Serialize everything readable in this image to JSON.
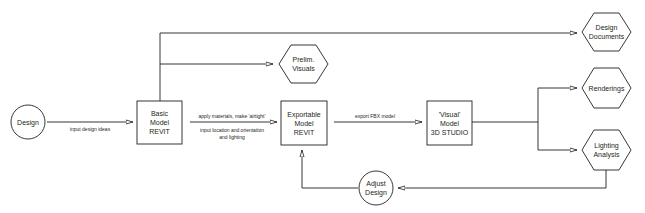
{
  "diagram": {
    "nodes": {
      "design": {
        "shape": "circle",
        "label_lines": [
          "Design"
        ]
      },
      "basic_model": {
        "shape": "box",
        "label_lines": [
          "Basic",
          "Model",
          "REVIT"
        ]
      },
      "prelim_visuals": {
        "shape": "hexagon",
        "label_lines": [
          "Prelim.",
          "Visuals"
        ]
      },
      "exportable_model": {
        "shape": "box",
        "label_lines": [
          "Exportable",
          "Model",
          "REVIT"
        ]
      },
      "visual_model": {
        "shape": "box",
        "label_lines": [
          "'Visual'",
          "Model",
          "3D STUDIO"
        ]
      },
      "design_documents": {
        "shape": "hexagon",
        "label_lines": [
          "Design",
          "Documents"
        ]
      },
      "renderings": {
        "shape": "hexagon",
        "label_lines": [
          "Renderings"
        ]
      },
      "lighting_analysis": {
        "shape": "hexagon",
        "label_lines": [
          "Lighting",
          "Analysis"
        ]
      },
      "adjust_design": {
        "shape": "circle",
        "label_lines": [
          "Adjust",
          "Design"
        ]
      }
    },
    "edges": {
      "design_to_basic": {
        "from": "Design",
        "to": "Basic Model REVIT",
        "label": "input design ideas"
      },
      "basic_to_exportable": {
        "from": "Basic Model REVIT",
        "to": "Exportable Model REVIT",
        "label_above": "apply materials, make 'airtight'",
        "label_below_1": "input location and orientation",
        "label_below_2": "and lighting"
      },
      "exportable_to_visual": {
        "from": "Exportable Model REVIT",
        "to": "'Visual' Model 3D STUDIO",
        "label": "export FBX model"
      },
      "basic_to_prelim": {
        "from": "Basic Model REVIT",
        "to": "Prelim. Visuals"
      },
      "basic_to_documents": {
        "from": "Basic Model REVIT",
        "to": "Design Documents"
      },
      "visual_to_renderings": {
        "from": "'Visual' Model 3D STUDIO",
        "to": "Renderings"
      },
      "visual_to_lighting": {
        "from": "'Visual' Model 3D STUDIO",
        "to": "Lighting Analysis"
      },
      "lighting_to_adjust": {
        "from": "Lighting Analysis",
        "to": "Adjust Design"
      },
      "adjust_to_exportable": {
        "from": "Adjust Design",
        "to": "Exportable Model REVIT"
      }
    }
  }
}
